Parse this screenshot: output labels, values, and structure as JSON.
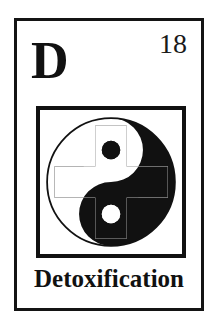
{
  "card": {
    "element_symbol": "D",
    "atomic_number": "18",
    "element_name": "Detoxification",
    "frame_color": "#141414",
    "ink_color": "#111111",
    "paper_color": "#ffffff"
  },
  "pictogram": {
    "name": "yin-yang-cross-icon",
    "description": "yin yang symbol overlaid with a cross in inverted color",
    "circle_fill": "#111111",
    "circle_stroke": "#111111",
    "cross_color": "#111111",
    "dot_dark": "#111111",
    "dot_light": "#ffffff"
  }
}
